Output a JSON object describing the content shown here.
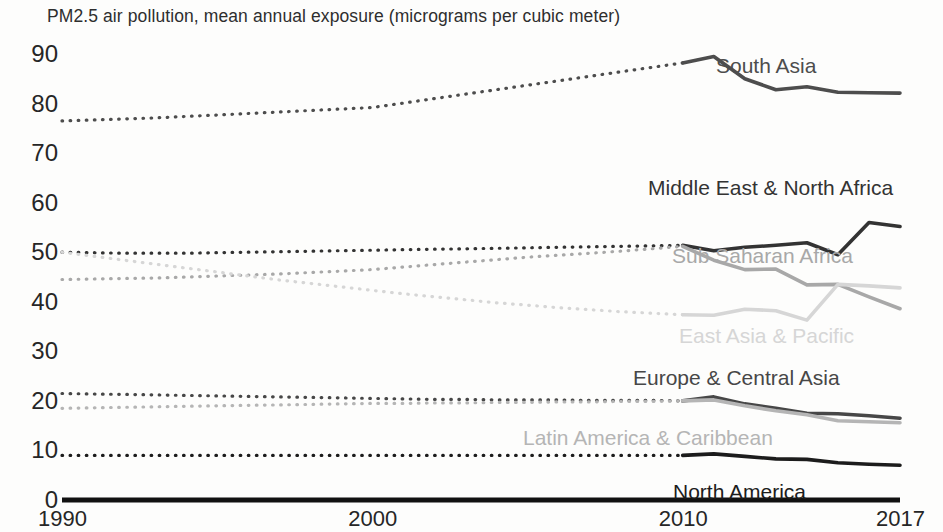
{
  "chart_data": {
    "type": "line",
    "title": "PM2.5 air pollution, mean annual exposure (micrograms per cubic meter)",
    "xlabel": "",
    "ylabel": "",
    "xlim": [
      1990,
      2017
    ],
    "ylim": [
      0,
      90
    ],
    "grid": false,
    "legend_position": "inline-right-of-series",
    "x_ticks": [
      "1990",
      "2000",
      "2010",
      "2017"
    ],
    "x_tick_values": [
      1990,
      2000,
      2010,
      2017
    ],
    "y_ticks": [
      "0",
      "10",
      "20",
      "30",
      "40",
      "50",
      "60",
      "70",
      "80",
      "90"
    ],
    "y_tick_values": [
      0,
      10,
      20,
      30,
      40,
      50,
      60,
      70,
      80,
      90
    ],
    "note": "Years 1990-2010 drawn dotted (interpolated), 2010-2017 drawn solid (observed)",
    "dotted_until": 2010,
    "x": [
      1990,
      1991,
      1992,
      1993,
      1994,
      1995,
      1996,
      1997,
      1998,
      1999,
      2000,
      2001,
      2002,
      2003,
      2004,
      2005,
      2006,
      2007,
      2008,
      2009,
      2010,
      2011,
      2012,
      2013,
      2014,
      2015,
      2016,
      2017
    ],
    "series": [
      {
        "name": "South Asia",
        "color": "#4d4d4d",
        "label_x": 716,
        "label_y": 55,
        "values": [
          76.5,
          76.7,
          76.9,
          77.1,
          77.4,
          77.7,
          78.0,
          78.3,
          78.6,
          78.9,
          79.2,
          80.1,
          81.0,
          81.9,
          82.8,
          83.7,
          84.6,
          85.5,
          86.4,
          87.3,
          88.2,
          89.5,
          85.0,
          82.8,
          83.4,
          82.3,
          82.2,
          82.1
        ]
      },
      {
        "name": "Middle East & North Africa",
        "color": "#333333",
        "label_x": 648,
        "label_y": 177,
        "values": [
          50.0,
          49.9,
          49.8,
          49.8,
          49.8,
          49.9,
          50.0,
          50.1,
          50.2,
          50.3,
          50.4,
          50.5,
          50.6,
          50.7,
          50.8,
          50.9,
          51.0,
          51.1,
          51.2,
          51.3,
          51.4,
          50.3,
          51.0,
          51.4,
          51.9,
          49.5,
          56.0,
          55.2
        ]
      },
      {
        "name": "Sub Saharan Africa",
        "color": "#a8a8a8",
        "label_x": 672,
        "label_y": 245,
        "values": [
          44.5,
          44.6,
          44.7,
          44.8,
          45.0,
          45.2,
          45.4,
          45.6,
          45.9,
          46.2,
          46.5,
          47.0,
          47.5,
          48.0,
          48.5,
          49.0,
          49.4,
          49.8,
          50.2,
          50.7,
          51.2,
          48.4,
          46.5,
          46.6,
          43.4,
          43.5,
          41.0,
          38.6
        ]
      },
      {
        "name": "East Asia & Pacific",
        "color": "#d6d6d6",
        "label_x": 679,
        "label_y": 325,
        "values": [
          50.0,
          49.2,
          48.4,
          47.6,
          46.8,
          46.0,
          45.2,
          44.4,
          43.7,
          43.0,
          42.3,
          41.6,
          41.0,
          40.4,
          39.8,
          39.3,
          38.8,
          38.4,
          38.0,
          37.7,
          37.4,
          37.3,
          38.5,
          38.2,
          36.3,
          43.5,
          43.2,
          42.8
        ]
      },
      {
        "name": "Europe & Central Asia",
        "color": "#474747",
        "label_x": 633,
        "label_y": 367,
        "values": [
          21.5,
          21.4,
          21.3,
          21.2,
          21.1,
          21.0,
          20.9,
          20.8,
          20.7,
          20.6,
          20.5,
          20.4,
          20.3,
          20.3,
          20.2,
          20.2,
          20.2,
          20.1,
          20.1,
          20.1,
          20.0,
          20.8,
          19.4,
          18.5,
          17.5,
          17.4,
          17.0,
          16.5
        ]
      },
      {
        "name": "Latin America & Caribbean",
        "color": "#b5b5b5",
        "label_x": 523,
        "label_y": 427,
        "values": [
          18.5,
          18.6,
          18.7,
          18.8,
          18.9,
          19.0,
          19.1,
          19.2,
          19.3,
          19.4,
          19.5,
          19.5,
          19.6,
          19.6,
          19.7,
          19.7,
          19.8,
          19.8,
          19.9,
          19.9,
          20.0,
          20.2,
          19.0,
          18.0,
          17.2,
          16.0,
          15.8,
          15.6
        ]
      },
      {
        "name": "North America",
        "color": "#1c1c1c",
        "label_x": 673,
        "label_y": 481,
        "values": [
          9.0,
          9.0,
          9.0,
          9.0,
          9.0,
          9.0,
          9.0,
          9.0,
          9.0,
          9.0,
          9.0,
          9.0,
          9.0,
          9.0,
          9.0,
          9.0,
          9.0,
          9.0,
          9.0,
          9.0,
          9.0,
          9.3,
          8.8,
          8.3,
          8.2,
          7.5,
          7.2,
          7.0
        ]
      }
    ]
  },
  "axis": {
    "y_label_x": 4,
    "x_axis_color": "#111111"
  }
}
